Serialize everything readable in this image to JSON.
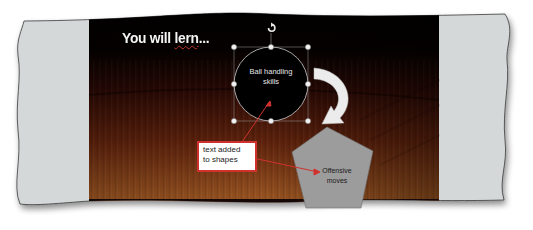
{
  "slide": {
    "title_prefix": "You will ",
    "title_misspelled": "lern",
    "title_suffix": "...",
    "background": "basketball court wood floor",
    "colors": {
      "side_panel": "#d4d8d9",
      "wood_dark": "#3a0d06",
      "wood_light": "#b5652a",
      "stripe": "#150806",
      "callout_border": "#d0312d",
      "pentagon_fill": "#9a9a9a",
      "arrow": "#e8e8e8"
    }
  },
  "shapes": {
    "circle": {
      "line1": "Ball handling",
      "line2": "skills",
      "selected": true
    },
    "pentagon": {
      "line1": "Offensive",
      "line2": "moves"
    },
    "curved_arrow": {
      "direction": "down-left"
    }
  },
  "callout": {
    "line1": "text added",
    "line2": "to shapes"
  }
}
